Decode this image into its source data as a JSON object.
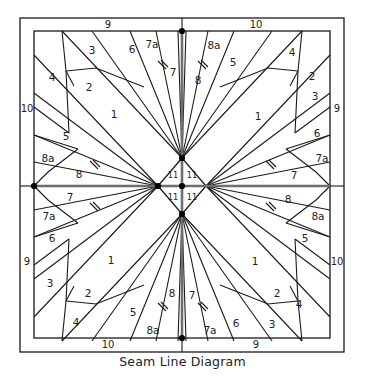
{
  "caption": "Seam Line Diagram",
  "diagram": {
    "type": "quilt-seam-line-diagram",
    "symmetry": "4-fold rotational",
    "colors": {
      "line": "#1a1a1a",
      "center_axis": "#6e6e6e",
      "node": "#000000",
      "background": "#ffffff",
      "text": "#232323"
    },
    "frame": {
      "x": 20,
      "y": 18,
      "width": 324,
      "height": 334
    },
    "inner_panel": {
      "x": 34,
      "y": 31,
      "width": 296,
      "height": 307
    },
    "center": {
      "x": 182,
      "y": 186
    },
    "center_diamond_labels": [
      "11",
      "11",
      "11",
      "11"
    ],
    "border_strip_labels": {
      "top_left": "9",
      "top_right": "10",
      "right_top": "9",
      "right_bottom": "10",
      "bottom_right": "9",
      "bottom_left": "10",
      "left_top": "10",
      "left_bottom": "9"
    },
    "piece_labels_per_quadrant": [
      "1",
      "2",
      "3",
      "4",
      "5",
      "6",
      "7",
      "7a",
      "8",
      "8a",
      "11"
    ],
    "patch_labels": [
      {
        "id": "tl-4",
        "text": "4",
        "x": 52,
        "y": 78
      },
      {
        "id": "tl-3",
        "text": "3",
        "x": 92,
        "y": 51
      },
      {
        "id": "tl-2",
        "text": "2",
        "x": 89,
        "y": 88
      },
      {
        "id": "tl-1",
        "text": "1",
        "x": 114,
        "y": 115
      },
      {
        "id": "tl-6",
        "text": "6",
        "x": 132,
        "y": 50
      },
      {
        "id": "tl-7a",
        "text": "7a",
        "x": 152,
        "y": 45
      },
      {
        "id": "tl-7",
        "text": "7",
        "x": 173,
        "y": 73
      },
      {
        "id": "tl-5",
        "text": "5",
        "x": 66,
        "y": 137
      },
      {
        "id": "tl-8a",
        "text": "8a",
        "x": 48,
        "y": 159
      },
      {
        "id": "tl-8",
        "text": "8",
        "x": 79,
        "y": 175
      },
      {
        "id": "tr-8",
        "text": "8",
        "x": 198,
        "y": 81
      },
      {
        "id": "tr-8a",
        "text": "8a",
        "x": 214,
        "y": 46
      },
      {
        "id": "tr-5",
        "text": "5",
        "x": 233,
        "y": 63
      },
      {
        "id": "tr-4",
        "text": "4",
        "x": 292,
        "y": 53
      },
      {
        "id": "tr-2",
        "text": "2",
        "x": 312,
        "y": 77
      },
      {
        "id": "tr-3",
        "text": "3",
        "x": 315,
        "y": 97
      },
      {
        "id": "tr-1",
        "text": "1",
        "x": 258,
        "y": 117
      },
      {
        "id": "tr-6",
        "text": "6",
        "x": 317,
        "y": 134
      },
      {
        "id": "tr-7a",
        "text": "7a",
        "x": 322,
        "y": 159
      },
      {
        "id": "tr-7",
        "text": "7",
        "x": 294,
        "y": 176
      },
      {
        "id": "bl-7",
        "text": "7",
        "x": 70,
        "y": 198
      },
      {
        "id": "bl-7a",
        "text": "7a",
        "x": 49,
        "y": 217
      },
      {
        "id": "bl-6",
        "text": "6",
        "x": 52,
        "y": 239
      },
      {
        "id": "bl-3",
        "text": "3",
        "x": 50,
        "y": 284
      },
      {
        "id": "bl-1",
        "text": "1",
        "x": 111,
        "y": 261
      },
      {
        "id": "bl-2",
        "text": "2",
        "x": 88,
        "y": 294
      },
      {
        "id": "bl-4",
        "text": "4",
        "x": 76,
        "y": 323
      },
      {
        "id": "bl-5",
        "text": "5",
        "x": 133,
        "y": 313
      },
      {
        "id": "bl-8a",
        "text": "8a",
        "x": 153,
        "y": 331
      },
      {
        "id": "bl-8",
        "text": "8",
        "x": 172,
        "y": 294
      },
      {
        "id": "br-8",
        "text": "8",
        "x": 288,
        "y": 200
      },
      {
        "id": "br-8a",
        "text": "8a",
        "x": 318,
        "y": 217
      },
      {
        "id": "br-5",
        "text": "5",
        "x": 305,
        "y": 239
      },
      {
        "id": "br-10r",
        "text": "",
        "x": 0,
        "y": 0
      },
      {
        "id": "br-1",
        "text": "1",
        "x": 255,
        "y": 262
      },
      {
        "id": "br-2",
        "text": "2",
        "x": 277,
        "y": 294
      },
      {
        "id": "br-4",
        "text": "4",
        "x": 299,
        "y": 305
      },
      {
        "id": "br-3",
        "text": "3",
        "x": 272,
        "y": 325
      },
      {
        "id": "br-6",
        "text": "6",
        "x": 236,
        "y": 324
      },
      {
        "id": "br-7a",
        "text": "7a",
        "x": 210,
        "y": 331
      },
      {
        "id": "br-7",
        "text": "7",
        "x": 192,
        "y": 296
      }
    ]
  }
}
